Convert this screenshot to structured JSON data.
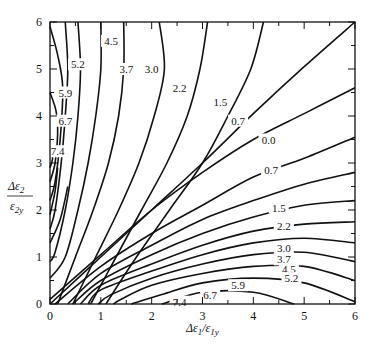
{
  "chart_data": {
    "type": "contour",
    "title": "",
    "xlabel": "Δε1/ε1y",
    "ylabel": "Δε2/ε2y",
    "xlim": [
      0,
      6
    ],
    "ylim": [
      0,
      6
    ],
    "xticks": [
      0,
      1,
      2,
      3,
      4,
      5,
      6
    ],
    "yticks": [
      0,
      1,
      2,
      3,
      4,
      5,
      6
    ],
    "grid": false,
    "levels": [
      0.0,
      0.7,
      1.5,
      2.2,
      3.0,
      3.7,
      4.5,
      5.2,
      5.9,
      6.7,
      7.4
    ],
    "upper_family": [
      {
        "level": "4.5",
        "label_pos": [
          1.2,
          5.6
        ],
        "points": [
          [
            0.55,
            6
          ],
          [
            0.6,
            5
          ],
          [
            0.55,
            4
          ],
          [
            0.45,
            3
          ],
          [
            0.3,
            2
          ],
          [
            0.1,
            1.1
          ],
          [
            0,
            0.9
          ]
        ]
      },
      {
        "level": "5.2",
        "label_pos": [
          0.55,
          5.1
        ],
        "points": [
          [
            0.3,
            6
          ],
          [
            0.35,
            5
          ],
          [
            0.3,
            4
          ],
          [
            0.22,
            3
          ],
          [
            0.1,
            2
          ],
          [
            0,
            1.6
          ]
        ]
      },
      {
        "level": "5.9",
        "label_pos": [
          0.3,
          4.5
        ],
        "points": [
          [
            0,
            5.9
          ],
          [
            0.15,
            5.3
          ],
          [
            0.25,
            4.6
          ],
          [
            0.2,
            3.5
          ],
          [
            0.1,
            2.6
          ],
          [
            0,
            2.2
          ]
        ]
      },
      {
        "level": "6.7",
        "label_pos": [
          0.3,
          3.9
        ],
        "points": [
          [
            0,
            4.5
          ],
          [
            0.12,
            4.1
          ],
          [
            0.15,
            3.6
          ],
          [
            0.1,
            3
          ],
          [
            0,
            2.6
          ]
        ]
      },
      {
        "level": "7.4",
        "label_pos": [
          0.15,
          3.25
        ],
        "points": [
          [
            0,
            3.3
          ],
          [
            0.05,
            3.1
          ],
          [
            0,
            2.9
          ]
        ]
      },
      {
        "level": "3.7",
        "label_pos": [
          1.5,
          5.0
        ],
        "points": [
          [
            1.0,
            6
          ],
          [
            1.0,
            5
          ],
          [
            0.9,
            4
          ],
          [
            0.75,
            3
          ],
          [
            0.55,
            2
          ],
          [
            0.3,
            1
          ],
          [
            0,
            0.55
          ]
        ]
      },
      {
        "level": "3.0",
        "label_pos": [
          2.0,
          5.0
        ],
        "points": [
          [
            1.45,
            6
          ],
          [
            1.45,
            5
          ],
          [
            1.35,
            4
          ],
          [
            1.15,
            3
          ],
          [
            0.85,
            2
          ],
          [
            0.5,
            1
          ],
          [
            0.15,
            0
          ]
        ]
      },
      {
        "level": "2.2",
        "label_pos": [
          2.55,
          4.6
        ],
        "points": [
          [
            2.15,
            6
          ],
          [
            2.25,
            5
          ],
          [
            2.05,
            4
          ],
          [
            1.75,
            3
          ],
          [
            1.35,
            2
          ],
          [
            0.9,
            1
          ],
          [
            0.45,
            0
          ]
        ]
      },
      {
        "level": "1.5",
        "label_pos": [
          3.35,
          4.3
        ],
        "points": [
          [
            3.1,
            6
          ],
          [
            2.95,
            5
          ],
          [
            2.7,
            4
          ],
          [
            2.3,
            3
          ],
          [
            1.8,
            2
          ],
          [
            1.3,
            1
          ],
          [
            0.8,
            0
          ]
        ]
      },
      {
        "level": "0.7",
        "label_pos": [
          3.7,
          3.9
        ],
        "points": [
          [
            4.2,
            6
          ],
          [
            3.95,
            5
          ],
          [
            3.5,
            4
          ],
          [
            3.0,
            3
          ],
          [
            2.35,
            2
          ],
          [
            1.7,
            1
          ],
          [
            1.1,
            0
          ]
        ]
      },
      {
        "level": "0.0",
        "label_pos": [
          4.3,
          3.5
        ],
        "points": [
          [
            6,
            6
          ],
          [
            5,
            5.05
          ],
          [
            4,
            4.05
          ],
          [
            3,
            3.0
          ],
          [
            2,
            2.0
          ],
          [
            1,
            1.0
          ],
          [
            0,
            0
          ]
        ]
      }
    ],
    "lower_family": [
      {
        "level": "0.7",
        "label_pos": [
          4.35,
          2.85
        ],
        "points": [
          [
            6,
            4.6
          ],
          [
            5,
            4.05
          ],
          [
            4,
            3.5
          ],
          [
            3,
            2.8
          ],
          [
            2,
            2.0
          ],
          [
            1,
            1.05
          ],
          [
            0,
            0.1
          ]
        ]
      },
      {
        "level": "1.5",
        "label_pos": [
          4.5,
          2.05
        ],
        "points": [
          [
            6,
            3.55
          ],
          [
            5,
            3.1
          ],
          [
            4,
            2.7
          ],
          [
            3,
            2.1
          ],
          [
            2,
            1.5
          ],
          [
            1,
            0.8
          ],
          [
            0.1,
            0
          ]
        ]
      },
      {
        "level": "2.2",
        "label_pos": [
          4.6,
          1.65
        ],
        "points": [
          [
            6,
            2.8
          ],
          [
            5,
            2.55
          ],
          [
            4,
            2.2
          ],
          [
            3,
            1.8
          ],
          [
            2,
            1.25
          ],
          [
            1,
            0.65
          ],
          [
            0.35,
            0
          ]
        ]
      },
      {
        "level": "3.0",
        "label_pos": [
          4.6,
          1.2
        ],
        "points": [
          [
            6,
            2.2
          ],
          [
            5,
            2.1
          ],
          [
            4,
            1.85
          ],
          [
            3,
            1.5
          ],
          [
            2,
            1.05
          ],
          [
            1,
            0.5
          ],
          [
            0.45,
            0
          ]
        ]
      },
      {
        "level": "3.7",
        "label_pos": [
          4.6,
          0.95
        ],
        "points": [
          [
            6,
            1.75
          ],
          [
            5,
            1.7
          ],
          [
            4,
            1.55
          ],
          [
            3,
            1.25
          ],
          [
            2,
            0.85
          ],
          [
            1,
            0.4
          ],
          [
            0.6,
            0
          ]
        ]
      },
      {
        "level": "4.5",
        "label_pos": [
          4.7,
          0.75
        ],
        "points": [
          [
            6,
            1.3
          ],
          [
            5,
            1.4
          ],
          [
            4,
            1.3
          ],
          [
            3,
            1.05
          ],
          [
            2,
            0.7
          ],
          [
            1,
            0.3
          ],
          [
            0.75,
            0
          ]
        ]
      },
      {
        "level": "5.2",
        "label_pos": [
          4.75,
          0.55
        ],
        "points": [
          [
            6,
            0.9
          ],
          [
            5,
            1.1
          ],
          [
            4,
            1.05
          ],
          [
            3,
            0.85
          ],
          [
            2,
            0.55
          ],
          [
            1.2,
            0.2
          ],
          [
            0.95,
            0
          ]
        ]
      },
      {
        "level": "5.9",
        "label_pos": [
          3.7,
          0.4
        ],
        "points": [
          [
            6,
            0.5
          ],
          [
            5,
            0.8
          ],
          [
            4,
            0.8
          ],
          [
            3,
            0.65
          ],
          [
            2,
            0.4
          ],
          [
            1.4,
            0.1
          ],
          [
            1.25,
            0
          ]
        ]
      },
      {
        "level": "6.7",
        "label_pos": [
          3.15,
          0.2
        ],
        "points": [
          [
            6,
            0.05
          ],
          [
            5,
            0.45
          ],
          [
            4,
            0.55
          ],
          [
            3,
            0.45
          ],
          [
            2.2,
            0.2
          ],
          [
            1.6,
            0
          ]
        ]
      },
      {
        "level": "7.4",
        "label_pos": [
          2.55,
          0.05
        ],
        "points": [
          [
            4.8,
            0
          ],
          [
            4,
            0.25
          ],
          [
            3,
            0.25
          ],
          [
            2.2,
            0
          ]
        ]
      }
    ],
    "extra_unlabeled_upper": [
      [
        [
          0,
          1.3
        ],
        [
          0.2,
          1.8
        ],
        [
          0.35,
          2.5
        ]
      ],
      [
        [
          0,
          1.9
        ],
        [
          0.1,
          2.4
        ],
        [
          0.15,
          2.9
        ]
      ]
    ]
  }
}
